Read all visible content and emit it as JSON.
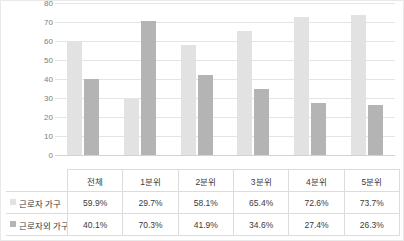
{
  "chart_data": {
    "type": "bar",
    "title": "",
    "xlabel": "",
    "ylabel": "",
    "ylim": [
      0,
      80
    ],
    "ytick_step": 10,
    "yticks": [
      "80",
      "70",
      "60",
      "50",
      "40",
      "30",
      "20",
      "10",
      "0"
    ],
    "grid": true,
    "legend_position": "table-row-headers",
    "categories": [
      "전체",
      "1분위",
      "2분위",
      "3분위",
      "4분위",
      "5분위"
    ],
    "series": [
      {
        "name": "근로자 가구",
        "color": "#e2e2e2",
        "values": [
          59.9,
          29.7,
          58.1,
          65.4,
          72.6,
          73.7
        ],
        "labels": [
          "59.9%",
          "29.7%",
          "58.1%",
          "65.4%",
          "72.6%",
          "73.7%"
        ]
      },
      {
        "name": "근로자외 가구",
        "color": "#b4b4b4",
        "values": [
          40.1,
          70.3,
          41.9,
          34.6,
          27.4,
          26.3
        ],
        "labels": [
          "40.1%",
          "70.3%",
          "41.9%",
          "34.6%",
          "27.4%",
          "26.3%"
        ]
      }
    ]
  },
  "table": {
    "header": [
      "",
      "전체",
      "1분위",
      "2분위",
      "3분위",
      "4분위",
      "5분위"
    ],
    "rows": [
      {
        "label": "근로자 가구",
        "swatch": "#e2e2e2",
        "values": [
          "59.9%",
          "29.7%",
          "58.1%",
          "65.4%",
          "72.6%",
          "73.7%"
        ]
      },
      {
        "label": "근로자외 가구",
        "swatch": "#b4b4b4",
        "values": [
          "40.1%",
          "70.3%",
          "41.9%",
          "34.6%",
          "27.4%",
          "26.3%"
        ]
      }
    ]
  }
}
